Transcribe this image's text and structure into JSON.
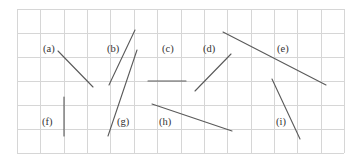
{
  "diagram": {
    "type": "line-segments-on-grid",
    "grid": {
      "left": 17,
      "top": 9,
      "right": 344,
      "bottom": 153,
      "columns": 14,
      "rows": 6,
      "line_color": "#d6d6d6"
    },
    "segment_color": "#5a5a5a",
    "segments": [
      {
        "id": "a",
        "label": "(a)",
        "label_pos": [
          43,
          52
        ],
        "x1": 58,
        "y1": 51,
        "x2": 93,
        "y2": 87
      },
      {
        "id": "b",
        "label": "(b)",
        "label_pos": [
          107,
          52
        ],
        "x1": 109,
        "y1": 85,
        "x2": 135,
        "y2": 30
      },
      {
        "id": "c",
        "label": "(c)",
        "label_pos": [
          162,
          52
        ],
        "x1": 148,
        "y1": 81,
        "x2": 186,
        "y2": 81
      },
      {
        "id": "d",
        "label": "(d)",
        "label_pos": [
          203,
          52
        ],
        "x1": 195,
        "y1": 91,
        "x2": 231,
        "y2": 54
      },
      {
        "id": "e",
        "label": "(e)",
        "label_pos": [
          277,
          52
        ],
        "x1": 223,
        "y1": 32,
        "x2": 326,
        "y2": 85
      },
      {
        "id": "f",
        "label": "(f)",
        "label_pos": [
          42,
          125
        ],
        "x1": 64,
        "y1": 97,
        "x2": 64,
        "y2": 136
      },
      {
        "id": "g",
        "label": "(g)",
        "label_pos": [
          117,
          125
        ],
        "x1": 137,
        "y1": 50,
        "x2": 108,
        "y2": 136
      },
      {
        "id": "h",
        "label": "(h)",
        "label_pos": [
          159,
          125
        ],
        "x1": 152,
        "y1": 104,
        "x2": 232,
        "y2": 131
      },
      {
        "id": "i",
        "label": "(i)",
        "label_pos": [
          276,
          125
        ],
        "x1": 272,
        "y1": 79,
        "x2": 300,
        "y2": 139
      }
    ]
  }
}
